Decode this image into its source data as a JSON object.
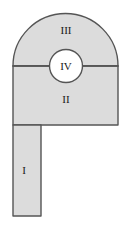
{
  "figure": {
    "background_color": "#ffffff",
    "fill_color": "#dcdcdc",
    "stroke_color": "#555555",
    "circle_fill_color": "#ffffff",
    "label_color": "#1a1a1a",
    "stroke_width": 1.4,
    "canvas": {
      "width": 127,
      "height": 228
    }
  },
  "regions": [
    {
      "id": "region-i",
      "label": "I",
      "shape": "rectangle",
      "description": "Narrow vertical leg descending from the lower-left of the body",
      "label_x": 24,
      "label_y": 171,
      "bounds": {
        "x": 13,
        "y": 125,
        "width": 28,
        "height": 91
      }
    },
    {
      "id": "region-ii",
      "label": "II",
      "shape": "rectangle",
      "description": "Wide rectangular body below the horizontal divider",
      "label_x": 66,
      "label_y": 100,
      "bounds": {
        "x": 13,
        "y": 66,
        "width": 105,
        "height": 59
      }
    },
    {
      "id": "region-iii",
      "label": "III",
      "shape": "semicircle",
      "description": "Semicircular dome above the horizontal divider",
      "label_x": 66,
      "label_y": 31,
      "center": {
        "x": 65.5,
        "y": 66
      },
      "radius": 52.5
    },
    {
      "id": "region-iv",
      "label": "IV",
      "shape": "circle",
      "description": "White circle straddling the divider between regions II and III",
      "label_x": 66,
      "label_y": 67,
      "center": {
        "x": 66,
        "y": 66
      },
      "radius": 16.5
    }
  ],
  "divider": {
    "id": "horizontal-divider",
    "description": "Horizontal line separating region III from region II",
    "x1": 13,
    "y1": 66,
    "x2": 118,
    "y2": 66
  }
}
